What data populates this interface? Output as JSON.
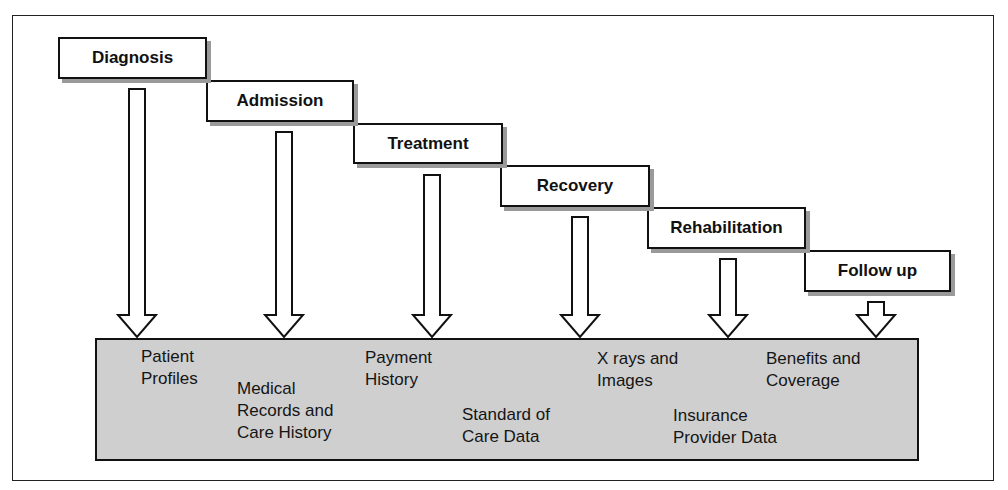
{
  "diagram": {
    "type": "process-flow",
    "stages": [
      {
        "label": "Diagnosis",
        "x": 58,
        "y": 37,
        "w": 149,
        "h": 42
      },
      {
        "label": "Admission",
        "x": 206,
        "y": 80,
        "w": 148,
        "h": 42
      },
      {
        "label": "Treatment",
        "x": 353,
        "y": 123,
        "w": 150,
        "h": 41
      },
      {
        "label": "Recovery",
        "x": 500,
        "y": 165,
        "w": 150,
        "h": 42
      },
      {
        "label": "Rehabilitation",
        "x": 647,
        "y": 207,
        "w": 159,
        "h": 42
      },
      {
        "label": "Follow up",
        "x": 804,
        "y": 250,
        "w": 147,
        "h": 42
      }
    ],
    "arrows": [
      {
        "cx": 137,
        "top": 89
      },
      {
        "cx": 284,
        "top": 132
      },
      {
        "cx": 432,
        "top": 175
      },
      {
        "cx": 580,
        "top": 217
      },
      {
        "cx": 728,
        "top": 259
      },
      {
        "cx": 876,
        "top": 302
      }
    ],
    "data_items": [
      {
        "label": "Patient\nProfiles",
        "x": 141,
        "y": 346
      },
      {
        "label": "Medical\nRecords and\nCare History",
        "x": 237,
        "y": 378
      },
      {
        "label": "Payment\nHistory",
        "x": 365,
        "y": 347
      },
      {
        "label": "Standard of\nCare Data",
        "x": 462,
        "y": 404
      },
      {
        "label": "X rays and\nImages",
        "x": 597,
        "y": 348
      },
      {
        "label": "Insurance\nProvider Data",
        "x": 673,
        "y": 405
      },
      {
        "label": "Benefits and\nCoverage",
        "x": 766,
        "y": 348
      }
    ],
    "colors": {
      "data_box": "#cfcfcf",
      "stroke": "#111111",
      "shadow": "#9a9a9a"
    }
  }
}
